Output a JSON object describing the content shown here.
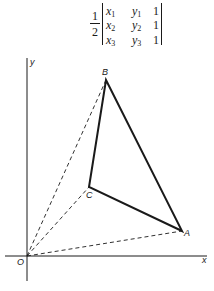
{
  "formula": {
    "coefficient": {
      "numerator": "1",
      "denominator": "2"
    },
    "rows": [
      {
        "x": "x",
        "x_sub": "1",
        "y": "y",
        "y_sub": "1",
        "one": "1"
      },
      {
        "x": "x",
        "x_sub": "2",
        "y": "y",
        "y_sub": "2",
        "one": "1"
      },
      {
        "x": "x",
        "x_sub": "3",
        "y": "y",
        "y_sub": "3",
        "one": "1"
      }
    ]
  },
  "figure": {
    "axes": {
      "x_label": "x",
      "y_label": "y",
      "origin_label": "O"
    },
    "points": [
      {
        "label": "A"
      },
      {
        "label": "B"
      },
      {
        "label": "C"
      }
    ],
    "line_color": "#1a1a1a"
  }
}
